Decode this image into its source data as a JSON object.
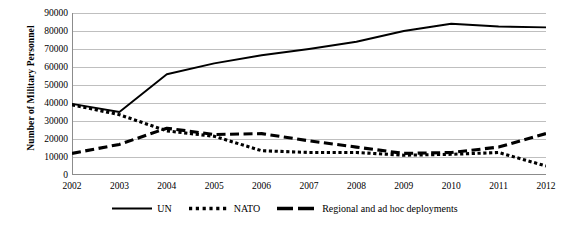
{
  "chart_data": {
    "type": "line",
    "title": "",
    "xlabel": "",
    "ylabel": "Number of Military Personnel",
    "x": [
      2002,
      2003,
      2004,
      2005,
      2006,
      2007,
      2008,
      2009,
      2010,
      2011,
      2012
    ],
    "categories": [
      "2002",
      "2003",
      "2004",
      "2005",
      "2006",
      "2007",
      "2008",
      "2009",
      "2010",
      "2011",
      "2012"
    ],
    "xlim": [
      2002,
      2012
    ],
    "ylim": [
      0,
      90000
    ],
    "ytick_values": [
      0,
      10000,
      20000,
      30000,
      40000,
      50000,
      60000,
      70000,
      80000,
      90000
    ],
    "ytick_labels": [
      "0",
      "10000",
      "20000",
      "30000",
      "40000",
      "50000",
      "60000",
      "70000",
      "80000",
      "90000"
    ],
    "grid": "horizontal",
    "legend_position": "bottom",
    "series": [
      {
        "name": "UN",
        "style": "solid",
        "color": "#000000",
        "values": [
          39500,
          35000,
          56000,
          62000,
          66500,
          70000,
          74000,
          80000,
          84000,
          82500,
          82000
        ]
      },
      {
        "name": "NATO",
        "style": "dotted",
        "color": "#000000",
        "values": [
          39000,
          33500,
          24500,
          21500,
          13500,
          12500,
          12500,
          11000,
          11500,
          12500,
          5000
        ]
      },
      {
        "name": "Regional and ad hoc deployments",
        "style": "dashed",
        "color": "#000000",
        "values": [
          12000,
          17000,
          26000,
          22500,
          23000,
          19000,
          15500,
          12000,
          12500,
          15500,
          23000
        ]
      }
    ]
  },
  "axes": {
    "y_title": "Number of Military Personnel"
  },
  "legend": {
    "items": [
      {
        "label": "UN",
        "swatch": "solid-line-swatch"
      },
      {
        "label": "NATO",
        "swatch": "dotted-line-swatch"
      },
      {
        "label": "Regional and ad hoc deployments",
        "swatch": "dashed-line-swatch"
      }
    ]
  },
  "colors": {
    "ink": "#000000",
    "gridline": "#bfbfbf",
    "axis": "#8c8c8c",
    "background": "#ffffff"
  }
}
